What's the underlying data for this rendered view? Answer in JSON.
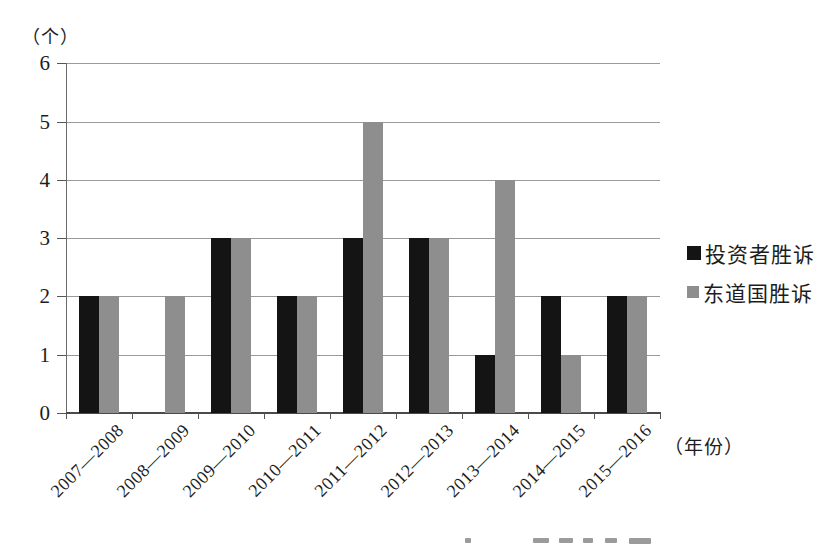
{
  "chart_data": {
    "type": "bar",
    "title": "",
    "ylabel": "（个）",
    "xlabel": "（年份）",
    "ylim": [
      0,
      6
    ],
    "yticks": [
      0,
      1,
      2,
      3,
      4,
      5,
      6
    ],
    "grid": true,
    "legend_position": "right",
    "categories": [
      "2007—2008",
      "2008—2009",
      "2009—2010",
      "2010—2011",
      "2011—2012",
      "2012—2013",
      "2013—2014",
      "2014—2015",
      "2015—2016"
    ],
    "series": [
      {
        "id": "investor-wins",
        "name": "投资者胜诉",
        "color": "#141414",
        "values": [
          2,
          0,
          3,
          2,
          3,
          3,
          1,
          2,
          2
        ]
      },
      {
        "id": "host-state-wins",
        "name": "东道国胜诉",
        "color": "#8e8e8e",
        "values": [
          2,
          2,
          3,
          2,
          5,
          3,
          4,
          1,
          2
        ]
      }
    ]
  },
  "colors": {
    "background": "#ffffff",
    "gridline": "#9a9a9a",
    "axis": "#555555",
    "text": "#1d1d1d",
    "bar_black": "#141414",
    "bar_gray": "#8e8e8e"
  }
}
